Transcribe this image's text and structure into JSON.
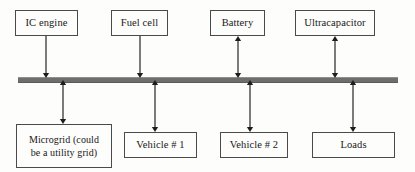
{
  "diagram": {
    "bus": {
      "name": "common-dc-bus",
      "color": "#6e6e6e",
      "x": 18,
      "y": 77,
      "width": 380,
      "height": 4
    },
    "sources": [
      {
        "id": "ic-engine",
        "label": "IC engine",
        "x": 15,
        "y": 10,
        "width": 63,
        "height": 26,
        "connector_x": 46,
        "arrow": "down"
      },
      {
        "id": "fuel-cell",
        "label": "Fuel cell",
        "x": 111,
        "y": 10,
        "width": 57,
        "height": 26,
        "connector_x": 140,
        "arrow": "down"
      },
      {
        "id": "battery",
        "label": "Battery",
        "x": 210,
        "y": 10,
        "width": 55,
        "height": 26,
        "connector_x": 238,
        "arrow": "both"
      },
      {
        "id": "ultracapacitor",
        "label": "Ultracapacitor",
        "x": 295,
        "y": 10,
        "width": 80,
        "height": 26,
        "connector_x": 335,
        "arrow": "both"
      }
    ],
    "loads": [
      {
        "id": "microgrid",
        "label": "Microgrid (could\nbe a utility grid)",
        "x": 16,
        "y": 124,
        "width": 96,
        "height": 44,
        "connector_x": 63,
        "arrow": "both",
        "lines": 2
      },
      {
        "id": "vehicle-1",
        "label": "Vehicle # 1",
        "x": 124,
        "y": 132,
        "width": 73,
        "height": 26,
        "connector_x": 155,
        "arrow": "both",
        "lines": 1
      },
      {
        "id": "vehicle-2",
        "label": "Vehicle # 2",
        "x": 220,
        "y": 132,
        "width": 68,
        "height": 26,
        "connector_x": 250,
        "arrow": "both",
        "lines": 1
      },
      {
        "id": "loads",
        "label": "Loads",
        "x": 312,
        "y": 132,
        "width": 83,
        "height": 26,
        "connector_x": 353,
        "arrow": "both",
        "lines": 1
      }
    ]
  }
}
